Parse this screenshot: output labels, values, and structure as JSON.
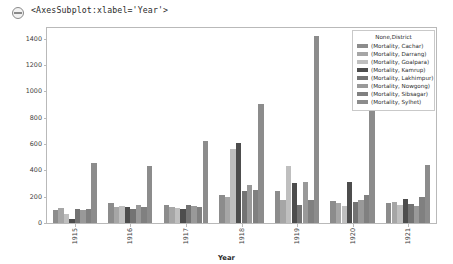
{
  "output": {
    "collapse_icon": "collapse-circle-icon",
    "repr_text": "<AxesSubplot:xlabel='Year'>"
  },
  "chart_data": {
    "type": "bar",
    "title": "",
    "xlabel": "Year",
    "ylabel": "",
    "categories": [
      "1915",
      "1916",
      "1917",
      "1918",
      "1919",
      "1920",
      "1921"
    ],
    "ylim": [
      0,
      1480
    ],
    "yticks": [
      0,
      200,
      400,
      600,
      800,
      1000,
      1200,
      1400
    ],
    "ytick_labels": [
      "0",
      "200",
      "400",
      "600",
      "800",
      "1000",
      "1200",
      "1400"
    ],
    "grid": false,
    "legend_position": "upper right",
    "legend_title": "None,District",
    "series": [
      {
        "name": "(Mortality, Cachar)",
        "color": "#8c8c8c",
        "values": [
          95,
          150,
          140,
          210,
          240,
          165,
          150
        ]
      },
      {
        "name": "(Mortality, Darrang)",
        "color": "#a6a6a6",
        "values": [
          115,
          120,
          125,
          200,
          175,
          155,
          160
        ]
      },
      {
        "name": "(Mortality, Goalpara)",
        "color": "#bfbfbf",
        "values": [
          70,
          130,
          115,
          560,
          430,
          130,
          135
        ]
      },
      {
        "name": "(Mortality, Kamrup)",
        "color": "#4d4d4d",
        "values": [
          30,
          120,
          105,
          610,
          300,
          310,
          180
        ]
      },
      {
        "name": "(Mortality, Lakhimpur)",
        "color": "#737373",
        "values": [
          110,
          110,
          140,
          245,
          135,
          160,
          145
        ]
      },
      {
        "name": "(Mortality, Nowgong)",
        "color": "#999999",
        "values": [
          100,
          140,
          130,
          285,
          310,
          175,
          130
        ]
      },
      {
        "name": "(Mortality, Sibsagar)",
        "color": "#808080",
        "values": [
          105,
          125,
          120,
          250,
          175,
          210,
          195
        ]
      },
      {
        "name": "(Mortality, Sylhet)",
        "color": "#8c8c8c",
        "values": [
          455,
          430,
          620,
          905,
          1420,
          855,
          440
        ]
      }
    ]
  }
}
